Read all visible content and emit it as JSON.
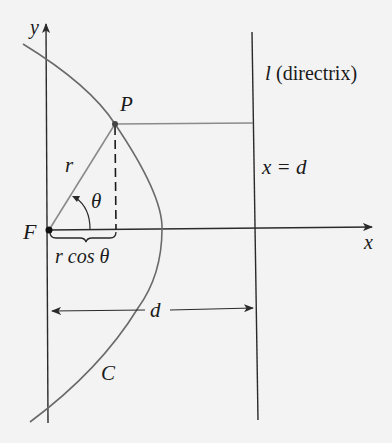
{
  "diagram": {
    "labels": {
      "y_axis": "y",
      "x_axis": "x",
      "point_p": "P",
      "focus": "F",
      "radius": "r",
      "angle": "θ",
      "projection": "r cos θ",
      "directrix_l": "l",
      "directrix_text": "(directrix)",
      "directrix_eq": "x = d",
      "distance": "d",
      "curve": "C"
    },
    "colors": {
      "background": "#f3f3f3",
      "axis": "#2a2a2a",
      "curve": "#666666",
      "helper": "#8a8a8a",
      "text": "#1a1a1a"
    }
  }
}
